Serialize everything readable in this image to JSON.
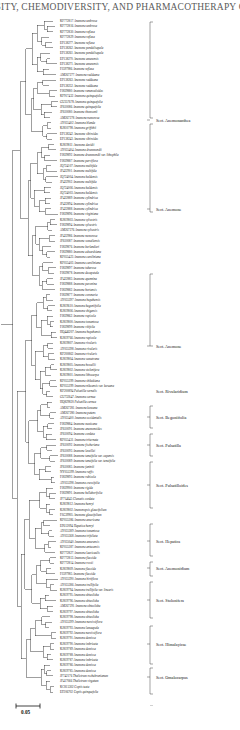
{
  "header": {
    "running_head": "RSITY, CHEMODIVERSITY, AND PHARMACOTHERAPY O"
  },
  "figure": {
    "type": "phylogenetic-tree",
    "scale_bar": {
      "label": "0.05",
      "length_units": 0.05
    }
  },
  "tips": [
    {
      "acc": "KF772817",
      "sp": "Anemone umbrosa"
    },
    {
      "acc": "KF772816",
      "sp": "Anemone umbrosa"
    },
    {
      "acc": "KF772830",
      "sp": "Anemone reflexa"
    },
    {
      "acc": "KF772829",
      "sp": "Anemone reflexa"
    },
    {
      "acc": "EF138277",
      "sp": "Anemone reflexa"
    },
    {
      "acc": "EF138262",
      "sp": "Anemone pendulisepala"
    },
    {
      "acc": "EF138261",
      "sp": "Anemone pendulisepala"
    },
    {
      "acc": "EF138270",
      "sp": "Anemone amurensis"
    },
    {
      "acc": "EF138271",
      "sp": "Anemone amurensis"
    },
    {
      "acc": "FJ597986",
      "sp": "Anemone reflexa"
    },
    {
      "acc": "AM267277",
      "sp": "Anemone raddeana"
    },
    {
      "acc": "EF138263",
      "sp": "Anemone raddeana"
    },
    {
      "acc": "EF138252",
      "sp": "Anemone raddeana"
    },
    {
      "acc": "FJ839880",
      "sp": "Anemone ranunculoides"
    },
    {
      "acc": "KF917432",
      "sp": "Anemone quinquefolia"
    },
    {
      "acc": "GU357678",
      "sp": "Anemone quinquefolia"
    },
    {
      "acc": "JF610086",
      "sp": "Anemone quinquefolia"
    },
    {
      "acc": "JF610080",
      "sp": "Anemone thomsonii"
    },
    {
      "acc": "AM267278",
      "sp": "Anemone nemorosa"
    },
    {
      "acc": "AY055402",
      "sp": "Anemone blanda"
    },
    {
      "acc": "KJ810798",
      "sp": "Anemone griffithii"
    },
    {
      "acc": "EF138242",
      "sp": "Anemone sibiroides"
    },
    {
      "acc": "EF138243",
      "sp": "Anemone sibiroides"
    },
    {
      "acc": "KJ819811",
      "sp": "Anemone davidii"
    },
    {
      "acc": "AY055404",
      "sp": "Anemone drummondii"
    },
    {
      "acc": "FJ839892",
      "sp": "Anemone drummondii var. lithophila"
    },
    {
      "acc": "FJ839887",
      "sp": "Anemone parviflora"
    },
    {
      "acc": "JQ724107",
      "sp": "Anemone multifida"
    },
    {
      "acc": "JF422901",
      "sp": "Anemone multifida"
    },
    {
      "acc": "JQ724004",
      "sp": "Anemone baldensis"
    },
    {
      "acc": "JF422902",
      "sp": "Anemone multifida"
    },
    {
      "acc": "JQ724006",
      "sp": "Anemone baldensis"
    },
    {
      "acc": "JQ724003",
      "sp": "Anemone baldensis"
    },
    {
      "acc": "JF422889",
      "sp": "Anemone cylindrica"
    },
    {
      "acc": "JF422894",
      "sp": "Anemone cylindrica"
    },
    {
      "acc": "JF422888",
      "sp": "Anemone cylindrica"
    },
    {
      "acc": "FJ839896",
      "sp": "Anemone virginiana"
    },
    {
      "acc": "KJ819803",
      "sp": "Anemone sylvestris"
    },
    {
      "acc": "FJ839894",
      "sp": "Anemone sylvestris"
    },
    {
      "acc": "AM267276",
      "sp": "Anemone sylvestris"
    },
    {
      "acc": "JF422986",
      "sp": "Anemone nemorosa"
    },
    {
      "acc": "JF610087",
      "sp": "Anemone somaliensis"
    },
    {
      "acc": "FJ839876",
      "sp": "Anemone berlandieri"
    },
    {
      "acc": "FJ839880",
      "sp": "Anemone edwardsiana"
    },
    {
      "acc": "KF055423",
      "sp": "Anemone caroliniana"
    },
    {
      "acc": "KF055403",
      "sp": "Anemone caroliniana"
    },
    {
      "acc": "FJ839897",
      "sp": "Anemone tuberosa"
    },
    {
      "acc": "FJ839878",
      "sp": "Anemone decapetala"
    },
    {
      "acc": "JF422883",
      "sp": "Anemone apennina"
    },
    {
      "acc": "FJ839888",
      "sp": "Anemone pavonina"
    },
    {
      "acc": "FJ839882",
      "sp": "Anemone hortensis"
    },
    {
      "acc": "FJ839877",
      "sp": "Anemone coronaria"
    },
    {
      "acc": "AY055397",
      "sp": "Anemone hupehensis"
    },
    {
      "acc": "KJ819610",
      "sp": "Anemone begoniifolia"
    },
    {
      "acc": "KJ819806",
      "sp": "Anemone shigensis"
    },
    {
      "acc": "FJ839862",
      "sp": "Anemone rupicola"
    },
    {
      "acc": "KJ819800",
      "sp": "Anemone tomentosa"
    },
    {
      "acc": "FJ839899",
      "sp": "Anemone vitifolia"
    },
    {
      "acc": "HQ446207",
      "sp": "Anemone hupehensis"
    },
    {
      "acc": "KJ819766",
      "sp": "Anemone rupicola"
    },
    {
      "acc": "KJ819807",
      "sp": "Anemone rivularis"
    },
    {
      "acc": "AY055398",
      "sp": "Anemone rivularis"
    },
    {
      "acc": "KF200862",
      "sp": "Anemone rivularis"
    },
    {
      "acc": "KJ819804",
      "sp": "Anemone sumatrana"
    },
    {
      "acc": "KJ819805",
      "sp": "Anemone howellii"
    },
    {
      "acc": "KJ819802",
      "sp": "Anemone stolonifera"
    },
    {
      "acc": "KJ819801",
      "sp": "Anemone lithocarpa"
    },
    {
      "acc": "KF055399",
      "sp": "Anemone shikokiana"
    },
    {
      "acc": "KF055399",
      "sp": "Anemone nikoensis var. koreana"
    },
    {
      "acc": "KF200894",
      "sp": "Pulsatilla vernalis"
    },
    {
      "acc": "GU732647",
      "sp": "Anemone cernua"
    },
    {
      "acc": "HQ829820",
      "sp": "Pulsatilla cernua"
    },
    {
      "acc": "AM267281",
      "sp": "Anemone koreana"
    },
    {
      "acc": "AM267280",
      "sp": "Anemone patens"
    },
    {
      "acc": "AY055400",
      "sp": "Anemone occidentalis"
    },
    {
      "acc": "FJ839884",
      "sp": "Anemone mexicana"
    },
    {
      "acc": "JF610091",
      "sp": "Anemone anemonoides"
    },
    {
      "acc": "JF610094",
      "sp": "Anemone cordata"
    },
    {
      "acc": "KF055431",
      "sp": "Anemone triternata"
    },
    {
      "acc": "JF610092",
      "sp": "Anemone fischeriana"
    },
    {
      "acc": "JF610093",
      "sp": "Anemone leveillei"
    },
    {
      "acc": "JF610088",
      "sp": "Anemone tenuifolia var. capensis"
    },
    {
      "acc": "JF610089",
      "sp": "Anemone tenuifolia var. tenuifolia"
    },
    {
      "acc": "JF610085",
      "sp": "Anemone faniniii"
    },
    {
      "acc": "NY055399",
      "sp": "Anemone raffis"
    },
    {
      "acc": "FJ839893",
      "sp": "Anemone rubicola"
    },
    {
      "acc": "AY055398",
      "sp": "Anemone crassifolia"
    },
    {
      "acc": "FJ839900",
      "sp": "Anemone rigida"
    },
    {
      "acc": "FJ839891",
      "sp": "Anemone hellaborifolia"
    },
    {
      "acc": "JF714645",
      "sp": "Clematis cordata"
    },
    {
      "acc": "KJ819812",
      "sp": "Anemone henryi"
    },
    {
      "acc": "KJ819802",
      "sp": "Anemonopsis glaucifolium"
    },
    {
      "acc": "FJG39905",
      "sp": "Anemone glaucifolium"
    },
    {
      "acc": "KF055386",
      "sp": "Anemone americana"
    },
    {
      "acc": "EF612094",
      "sp": "Hepatica henryi"
    },
    {
      "acc": "AY055389",
      "sp": "Anemone tomentosa"
    },
    {
      "acc": "AY055368",
      "sp": "Anemone trifoliata"
    },
    {
      "acc": "AY055040",
      "sp": "Anemone amurensis"
    },
    {
      "acc": "KF055387",
      "sp": "Anemone antucensis"
    },
    {
      "acc": "KF772827",
      "sp": "Anemone laevicaulis"
    },
    {
      "acc": "KF772813",
      "sp": "Anemone flaccida"
    },
    {
      "acc": "KF772814",
      "sp": "Anemone rossii"
    },
    {
      "acc": "KJ819809",
      "sp": "Anemone flaccida"
    },
    {
      "acc": "FJ597985",
      "sp": "Anemone flaccida"
    },
    {
      "acc": "AY055390",
      "sp": "Anemone hirtiflora"
    },
    {
      "acc": "AY055386",
      "sp": "Anemone trullifolia"
    },
    {
      "acc": "KJ819794",
      "sp": "Anemone trullifolia var. linearis"
    },
    {
      "acc": "KJ819795",
      "sp": "Anemone obtusiloba"
    },
    {
      "acc": "KJ819796",
      "sp": "Anemone obtusiloba"
    },
    {
      "acc": "AM267291",
      "sp": "Anemone obtusiloba"
    },
    {
      "acc": "KJ819797",
      "sp": "Anemone obtusiloba"
    },
    {
      "acc": "KJ819798",
      "sp": "Anemone obtusiloba"
    },
    {
      "acc": "AY055399",
      "sp": "Anemone narcissiflora"
    },
    {
      "acc": "KJ819793",
      "sp": "Anemone lamaepala"
    },
    {
      "acc": "KJ819792",
      "sp": "Anemone narcissiflora"
    },
    {
      "acc": "KJ819791",
      "sp": "Anemone demissa"
    },
    {
      "acc": "KJ819790",
      "sp": "Anemone imbricata"
    },
    {
      "acc": "KJ819789",
      "sp": "Anemone demissa"
    },
    {
      "acc": "KJ819788",
      "sp": "Anemone demissa"
    },
    {
      "acc": "KJ819787",
      "sp": "Anemone imbricata"
    },
    {
      "acc": "KJ819786",
      "sp": "Anemone demissa"
    },
    {
      "acc": "KJ819785",
      "sp": "Anemone demissa"
    },
    {
      "acc": "JF742176",
      "sp": "Thalictrum rochebrunianum"
    },
    {
      "acc": "JF417066",
      "sp": "Thalictrum virgatum"
    },
    {
      "acc": "KC815302",
      "sp": "Coptis teeta"
    },
    {
      "acc": "EF206702",
      "sp": "Coptis quinquefolia"
    }
  ],
  "sections": [
    {
      "label": "Sect. Anemonanthea",
      "y": 104
    },
    {
      "label": "Sect. Anemone",
      "y": 193
    },
    {
      "label": "Sect. Anemone",
      "y": 330
    },
    {
      "label": "Sect. Rivularidium",
      "y": 375
    },
    {
      "label": "Sect. Begoniifolia",
      "y": 401
    },
    {
      "label": "Sect. Pulsatilla",
      "y": 429
    },
    {
      "label": "Sect. Pulsatilloides",
      "y": 469
    },
    {
      "label": "Sect. Hepatica",
      "y": 525
    },
    {
      "label": "Sect. Anemonidium",
      "y": 552
    },
    {
      "label": "Sect. Stolonifera",
      "y": 584
    },
    {
      "label": "Sect. Himalayicae",
      "y": 628
    },
    {
      "label": "Sect. Omalocarpus",
      "y": 661
    },
    {
      "label": "outgroup",
      "y": 700
    }
  ]
}
